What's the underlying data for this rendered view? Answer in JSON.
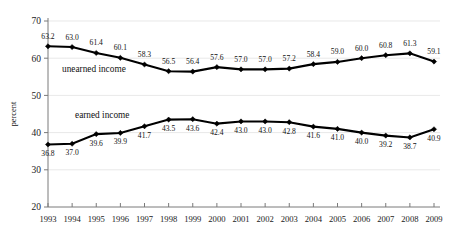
{
  "chart_data": {
    "type": "line",
    "title": "",
    "xlabel": "",
    "ylabel": "percent",
    "ylim": [
      20,
      70
    ],
    "yticks": [
      20,
      30,
      40,
      50,
      60,
      70
    ],
    "ytick_labels": [
      "20",
      "30",
      "40",
      "50",
      "60",
      "70"
    ],
    "grid": true,
    "grid_axis": "y",
    "legend": "inline-annotations",
    "categories": [
      1993,
      1994,
      1995,
      1996,
      1997,
      1998,
      1999,
      2000,
      2001,
      2002,
      2003,
      2004,
      2005,
      2006,
      2007,
      2008,
      2009
    ],
    "xtick_labels": [
      "1993",
      "1994",
      "1995",
      "1996",
      "1997",
      "1998",
      "1999",
      "2000",
      "2001",
      "2002",
      "2003",
      "2004",
      "2005",
      "2006",
      "2007",
      "2008",
      "2009"
    ],
    "series": [
      {
        "name": "unearned income",
        "color": "#000000",
        "marker": "diamond",
        "values": [
          63.2,
          63.0,
          61.4,
          60.1,
          58.3,
          56.5,
          56.4,
          57.6,
          57.0,
          57.0,
          57.2,
          58.4,
          59.0,
          60.0,
          60.8,
          61.3,
          59.1
        ],
        "labels": [
          "63.2",
          "63.0",
          "61.4",
          "60.1",
          "58.3",
          "56.5",
          "56.4",
          "57.6",
          "57.0",
          "57.0",
          "57.2",
          "58.4",
          "59.0",
          "60.0",
          "60.8",
          "61.3",
          "59.1"
        ],
        "annotation": "unearned income"
      },
      {
        "name": "earned income",
        "color": "#000000",
        "marker": "diamond",
        "values": [
          36.8,
          37.0,
          39.6,
          39.9,
          41.7,
          43.5,
          43.6,
          42.4,
          43.0,
          43.0,
          42.8,
          41.6,
          41.0,
          40.0,
          39.2,
          38.7,
          40.9
        ],
        "labels": [
          "36.8",
          "37.0",
          "39.6",
          "39.9",
          "41.7",
          "43.5",
          "43.6",
          "42.4",
          "43.0",
          "43.0",
          "42.8",
          "41.6",
          "41.0",
          "40.0",
          "39.2",
          "38.7",
          "40.9"
        ],
        "annotation": "earned income"
      }
    ]
  }
}
